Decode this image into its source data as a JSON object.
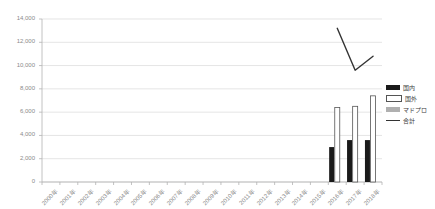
{
  "chart_data": {
    "type": "bar",
    "title": "",
    "subtitle": "",
    "xlabel": "",
    "ylabel": "",
    "ylim": [
      0,
      14000
    ],
    "ytick_step": 2000,
    "ytick_labels": [
      "0",
      "2,000",
      "4,000",
      "6,000",
      "8,000",
      "10,000",
      "12,000",
      "14,000"
    ],
    "ytick_values": [
      0,
      2000,
      4000,
      6000,
      8000,
      10000,
      12000,
      14000
    ],
    "grid": true,
    "grid_axis": "y",
    "legend_position": "right",
    "categories": [
      "2000年",
      "2001年",
      "2002年",
      "2003年",
      "2004年",
      "2005年",
      "2006年",
      "2007年",
      "2008年",
      "2009年",
      "2010年",
      "2011年",
      "2012年",
      "2013年",
      "2014年",
      "2015年",
      "2016年",
      "2017年",
      "2018年"
    ],
    "series": [
      {
        "name": "国内",
        "type": "bar",
        "color": "#1a1a1a",
        "values": [
          null,
          null,
          null,
          null,
          null,
          null,
          null,
          null,
          null,
          null,
          null,
          null,
          null,
          null,
          null,
          null,
          3000,
          3600,
          3600
        ]
      },
      {
        "name": "国外",
        "type": "bar",
        "color": "#ffffff",
        "values": [
          null,
          null,
          null,
          null,
          null,
          null,
          null,
          null,
          null,
          null,
          null,
          null,
          null,
          null,
          null,
          null,
          6400,
          6500,
          7400
        ]
      },
      {
        "name": "マドプロ",
        "type": "bar",
        "color": "#b0b0b0",
        "values": [
          null,
          null,
          null,
          null,
          null,
          null,
          null,
          null,
          null,
          null,
          null,
          null,
          null,
          null,
          null,
          null,
          null,
          null,
          null
        ]
      },
      {
        "name": "合計",
        "type": "line",
        "color": "#333333",
        "values": [
          null,
          null,
          null,
          null,
          null,
          null,
          null,
          null,
          null,
          null,
          null,
          null,
          null,
          null,
          null,
          null,
          13200,
          9600,
          10800
        ]
      }
    ],
    "legend": [
      "国内",
      "国外",
      "マドプロ",
      "合計"
    ]
  },
  "axis": {
    "y_labels": [
      "14,000",
      "12,000",
      "10,000",
      "8,000",
      "6,000",
      "4,000",
      "2,000",
      "0"
    ],
    "x_labels": [
      "2000年",
      "2001年",
      "2002年",
      "2003年",
      "2004年",
      "2005年",
      "2006年",
      "2007年",
      "2008年",
      "2009年",
      "2010年",
      "2011年",
      "2012年",
      "2013年",
      "2014年",
      "2015年",
      "2016年",
      "2017年",
      "2018年"
    ]
  },
  "legend": {
    "items": [
      {
        "label": "国内",
        "key": "domestic",
        "color": "#1a1a1a",
        "style": "solid-fill"
      },
      {
        "label": "国外",
        "key": "overseas",
        "color": "#ffffff",
        "style": "outline-fill"
      },
      {
        "label": "マドプロ",
        "key": "madrid",
        "color": "#b0b0b0",
        "style": "gray-fill"
      },
      {
        "label": "合計",
        "key": "total",
        "color": "#333333",
        "style": "line"
      }
    ]
  },
  "colors": {
    "gridline": "#d9d9d9",
    "axis": "#b3b3b3",
    "tick_text": "#8a8a8a",
    "bar_domestic": "#1a1a1a",
    "bar_overseas": "#ffffff",
    "bar_overseas_border": "#555555",
    "bar_madrid": "#b0b0b0",
    "line_total": "#333333",
    "background": "#ffffff"
  }
}
